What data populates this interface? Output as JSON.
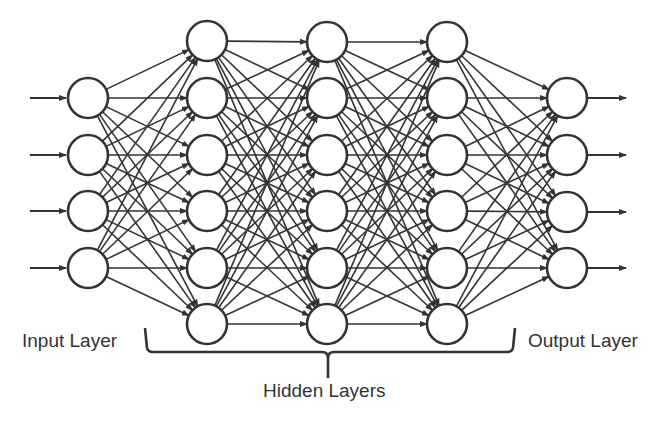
{
  "diagram": {
    "stroke_color": "#333333",
    "background": "#ffffff",
    "node_radius": 20,
    "layers": [
      {
        "name": "input",
        "x": 88,
        "nodes_y": [
          98,
          155,
          211,
          268
        ]
      },
      {
        "name": "hidden-1",
        "x": 207,
        "nodes_y": [
          41,
          98,
          155,
          211,
          268,
          324
        ]
      },
      {
        "name": "hidden-2",
        "x": 327,
        "nodes_y": [
          42,
          98,
          155,
          211,
          268,
          324
        ]
      },
      {
        "name": "hidden-3",
        "x": 447,
        "nodes_y": [
          42,
          98,
          155,
          211,
          268,
          324
        ]
      },
      {
        "name": "output",
        "x": 567,
        "nodes_y": [
          98,
          155,
          212,
          268
        ]
      }
    ],
    "input_arrows": {
      "x_start": 30,
      "x_end": 66
    },
    "output_arrows": {
      "x_start": 588,
      "x_end": 626
    },
    "bracket": {
      "x_left": 145,
      "x_right": 515,
      "y_top": 328,
      "y_line": 352,
      "x_center": 328,
      "y_tip": 378
    }
  },
  "labels": {
    "input_layer": "Input Layer",
    "hidden_layers": "Hidden Layers",
    "output_layer": "Output Layer"
  }
}
